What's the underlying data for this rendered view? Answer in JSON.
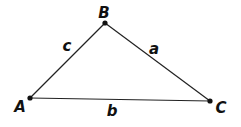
{
  "diagram": {
    "type": "triangle",
    "colors": {
      "line": "#222222",
      "vertex": "#111111",
      "text": "#111111",
      "background": "#ffffff"
    },
    "vertices": [
      {
        "id": "A",
        "label": "A",
        "x": 30,
        "y": 98,
        "label_x": 20,
        "label_y": 112
      },
      {
        "id": "B",
        "label": "B",
        "x": 105,
        "y": 23,
        "label_x": 104,
        "label_y": 18
      },
      {
        "id": "C",
        "label": "C",
        "x": 210,
        "y": 101,
        "label_x": 221,
        "label_y": 113
      }
    ],
    "sides": [
      {
        "id": "a",
        "label": "a",
        "from": "B",
        "to": "C",
        "label_x": 154,
        "label_y": 54
      },
      {
        "id": "b",
        "label": "b",
        "from": "A",
        "to": "C",
        "label_x": 112,
        "label_y": 116
      },
      {
        "id": "c",
        "label": "c",
        "from": "A",
        "to": "B",
        "label_x": 67,
        "label_y": 51
      }
    ]
  }
}
